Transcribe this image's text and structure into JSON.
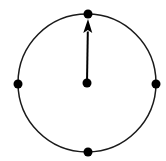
{
  "figure": {
    "background_color": "#ffffff",
    "stroke_color": "#1a1a1a",
    "fill_color": "#000000",
    "canvas": {
      "width": 166,
      "height": 161
    }
  },
  "chart_data": {
    "type": "scatter",
    "title": "",
    "xlabel": "",
    "ylabel": "",
    "grid": false,
    "legend": false,
    "circle": {
      "center_x": 87,
      "center_y": 83,
      "radius": 69,
      "stroke_width": 1.5,
      "stroke_color": "#1a1a1a",
      "fill": "none"
    },
    "points": [
      {
        "name": "center-point",
        "label": "center",
        "x": 87,
        "y": 83,
        "radius": 4.5,
        "color": "#000000"
      },
      {
        "name": "top-point",
        "label": "top",
        "x": 88,
        "y": 14,
        "radius": 4.5,
        "color": "#000000"
      },
      {
        "name": "right-point",
        "label": "right",
        "x": 156,
        "y": 84,
        "radius": 4.5,
        "color": "#000000"
      },
      {
        "name": "bottom-point",
        "label": "bottom",
        "x": 88,
        "y": 152,
        "radius": 4.5,
        "color": "#000000"
      },
      {
        "name": "left-point",
        "label": "left",
        "x": 18,
        "y": 84,
        "radius": 4.5,
        "color": "#000000"
      }
    ],
    "arrow": {
      "name": "radius-vector",
      "label": "upward vector",
      "from_x": 87,
      "from_y": 83,
      "to_x": 88,
      "to_y": 19,
      "shaft_width": 2,
      "head_width": 9,
      "head_length": 14,
      "color": "#000000",
      "direction": "up"
    }
  }
}
